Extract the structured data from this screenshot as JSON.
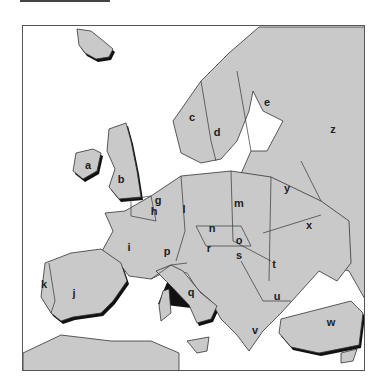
{
  "map": {
    "title": "Europe outline map with lettered countries",
    "colors": {
      "land": "#c9c9c9",
      "sea": "#ffffff",
      "border": "#333333",
      "shadow": "#111111"
    },
    "labels": [
      {
        "id": "a",
        "text": "a",
        "x": 88,
        "y": 165
      },
      {
        "id": "b",
        "text": "b",
        "x": 121,
        "y": 179
      },
      {
        "id": "c",
        "text": "c",
        "x": 192,
        "y": 117
      },
      {
        "id": "d",
        "text": "d",
        "x": 217,
        "y": 132
      },
      {
        "id": "e",
        "text": "e",
        "x": 267,
        "y": 102
      },
      {
        "id": "g",
        "text": "g",
        "x": 158,
        "y": 200
      },
      {
        "id": "h",
        "text": "h",
        "x": 154,
        "y": 211
      },
      {
        "id": "i",
        "text": "i",
        "x": 129,
        "y": 247
      },
      {
        "id": "j",
        "text": "j",
        "x": 74,
        "y": 293
      },
      {
        "id": "k",
        "text": "k",
        "x": 44,
        "y": 284
      },
      {
        "id": "l",
        "text": "l",
        "x": 184,
        "y": 209
      },
      {
        "id": "m",
        "text": "m",
        "x": 239,
        "y": 203
      },
      {
        "id": "n",
        "text": "n",
        "x": 212,
        "y": 228
      },
      {
        "id": "o",
        "text": "o",
        "x": 239,
        "y": 240
      },
      {
        "id": "p",
        "text": "p",
        "x": 167,
        "y": 251
      },
      {
        "id": "q",
        "text": "q",
        "x": 191,
        "y": 292
      },
      {
        "id": "r",
        "text": "r",
        "x": 209,
        "y": 248
      },
      {
        "id": "s",
        "text": "s",
        "x": 239,
        "y": 255
      },
      {
        "id": "t",
        "text": "t",
        "x": 274,
        "y": 264
      },
      {
        "id": "u",
        "text": "u",
        "x": 277,
        "y": 296
      },
      {
        "id": "v",
        "text": "v",
        "x": 255,
        "y": 330
      },
      {
        "id": "w",
        "text": "w",
        "x": 331,
        "y": 322
      },
      {
        "id": "x",
        "text": "x",
        "x": 309,
        "y": 225
      },
      {
        "id": "y",
        "text": "y",
        "x": 287,
        "y": 188
      },
      {
        "id": "z",
        "text": "z",
        "x": 333,
        "y": 129
      }
    ]
  }
}
